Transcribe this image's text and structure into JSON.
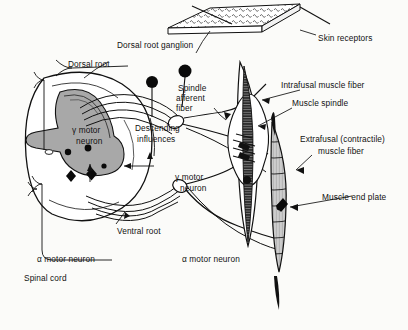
{
  "figure": {
    "type": "anatomical-line-drawing",
    "background_color": "#fbfbf9",
    "ink_color": "#111111",
    "gray_matter_color": "#a8a8a8"
  },
  "labels": {
    "dorsal_root_ganglion": "Dorsal root ganglion",
    "dorsal_root": "Dorsal root",
    "skin_receptors": "Skin receptors",
    "spindle_afferent_line1": "Spindle",
    "spindle_afferent_line2": "afferent",
    "spindle_afferent_line3": "fiber",
    "intrafusal": "Intrafusal muscle fiber",
    "muscle_spindle": "Muscle spindle",
    "descending_line1": "Descending",
    "descending_line2": "influences",
    "gamma_motor_left_line1": "γ motor",
    "gamma_motor_left_line2": "neuron",
    "gamma_motor_right_line1": "γ motor",
    "gamma_motor_right_line2": "neuron",
    "extrafusal_line1": "Extrafusal (contractile)",
    "extrafusal_line2": "muscle fiber",
    "muscle_end_plate": "Muscle end plate",
    "ventral_root": "Ventral root",
    "alpha_motor_left": "α motor neuron",
    "alpha_motor_right": "α motor neuron",
    "spinal_cord": "Spinal cord"
  },
  "structures": {
    "spinal_cord_section": "cross-section with butterfly gray matter",
    "ganglion_cells": 2,
    "muscle_spindle_fibers": "intrafusal fiber within fusiform capsule",
    "extrafusal_fiber": "striated tapered muscle fiber",
    "skin_patch": "slab with receptor endings"
  }
}
